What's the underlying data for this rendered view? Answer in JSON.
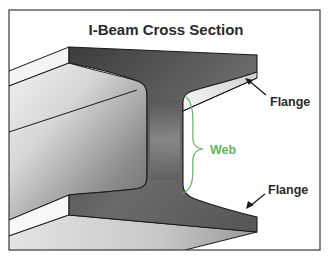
{
  "title": "I-Beam Cross Section",
  "labels": {
    "flange_top": "Flange",
    "web": "Web",
    "flange_bottom": "Flange"
  },
  "colors": {
    "background": "#ffffff",
    "frame": "#3a3a3a",
    "outline": "#1a1a1a",
    "section_dark": "#4a4a4a",
    "section_mid": "#8a8a8a",
    "surface_light": "#e8e8e8",
    "surface_shadow": "#9a9a9a",
    "web_accent": "#5cb85c",
    "text": "#2a2a2a"
  }
}
